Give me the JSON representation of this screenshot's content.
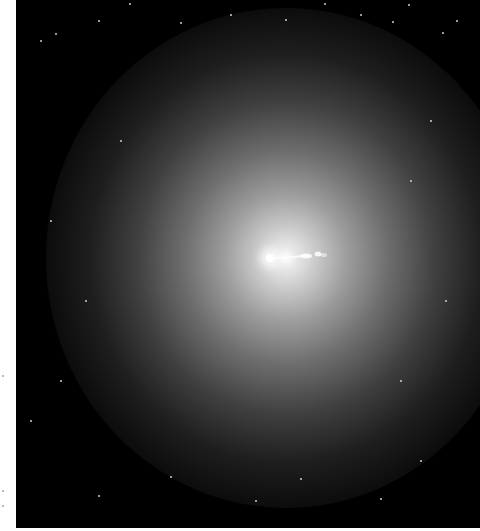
{
  "image": {
    "subject": "elliptical galaxy with relativistic jet",
    "background_color": "#000000",
    "core_color": "#ffffff",
    "frame": {
      "left": 16,
      "top": 0,
      "width": 464,
      "height": 528
    }
  },
  "stars": [
    [
      40,
      40
    ],
    [
      55,
      33
    ],
    [
      98,
      20
    ],
    [
      129,
      3
    ],
    [
      180,
      22
    ],
    [
      230,
      14
    ],
    [
      285,
      19
    ],
    [
      324,
      3
    ],
    [
      360,
      14
    ],
    [
      392,
      21
    ],
    [
      408,
      4
    ],
    [
      442,
      32
    ],
    [
      456,
      20
    ],
    [
      430,
      120
    ],
    [
      410,
      180
    ],
    [
      445,
      300
    ],
    [
      400,
      380
    ],
    [
      420,
      460
    ],
    [
      380,
      498
    ],
    [
      300,
      478
    ],
    [
      255,
      500
    ],
    [
      170,
      476
    ],
    [
      98,
      495
    ],
    [
      60,
      380
    ],
    [
      30,
      420
    ],
    [
      85,
      300
    ],
    [
      50,
      220
    ],
    [
      120,
      140
    ]
  ]
}
